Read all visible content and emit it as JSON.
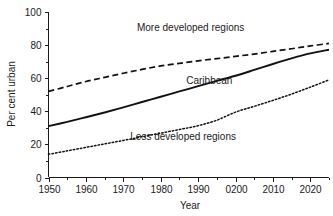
{
  "chart_data": {
    "type": "line",
    "title": "",
    "xlabel": "Year",
    "ylabel": "Per cent urban",
    "xlim": [
      1950,
      2025
    ],
    "ylim": [
      0,
      100
    ],
    "grid": false,
    "legend_position": "inline-annotations",
    "y_ticks": [
      "0",
      "20",
      "40",
      "60",
      "80",
      "100"
    ],
    "y_tick_values": [
      0,
      20,
      40,
      60,
      80,
      100
    ],
    "y_minor_tick_values": [
      10,
      30,
      50,
      70,
      90
    ],
    "x_ticks": [
      "1950",
      "1960",
      "1970",
      "1980",
      "1990",
      "0200",
      "2010",
      "2020"
    ],
    "x_tick_values": [
      1950,
      1960,
      1970,
      1980,
      1990,
      2000,
      2010,
      2020
    ],
    "x_minor_tick_values": [
      1955,
      1965,
      1975,
      1985,
      1995,
      2005,
      2015,
      2025
    ],
    "x": [
      1950,
      1955,
      1960,
      1965,
      1970,
      1975,
      1980,
      1985,
      1990,
      1995,
      2000,
      2005,
      2010,
      2015,
      2020,
      2025
    ],
    "series": [
      {
        "name": "More developed regions",
        "style": "dashed",
        "color": "#111111",
        "values": [
          52.0,
          55.0,
          58.0,
          60.5,
          63.0,
          65.3,
          67.4,
          69.0,
          70.5,
          71.8,
          73.2,
          74.6,
          76.2,
          77.8,
          79.5,
          81.0
        ],
        "label_x": 1988,
        "label_y": 90.5
      },
      {
        "name": "Caribbean",
        "style": "solid",
        "color": "#111111",
        "values": [
          31.0,
          33.6,
          36.4,
          39.3,
          42.4,
          45.6,
          48.8,
          52.0,
          55.2,
          58.4,
          61.5,
          65.0,
          68.6,
          72.0,
          75.0,
          77.2
        ],
        "label_x": 1993,
        "label_y": 58.5
      },
      {
        "name": "Less developed regions",
        "style": "dotted",
        "color": "#111111",
        "values": [
          14.0,
          16.1,
          18.2,
          20.3,
          22.4,
          24.6,
          26.8,
          29.0,
          31.3,
          34.6,
          39.5,
          43.0,
          46.6,
          50.4,
          54.6,
          59.0
        ],
        "label_x": 1986,
        "label_y": 25.0
      }
    ]
  }
}
